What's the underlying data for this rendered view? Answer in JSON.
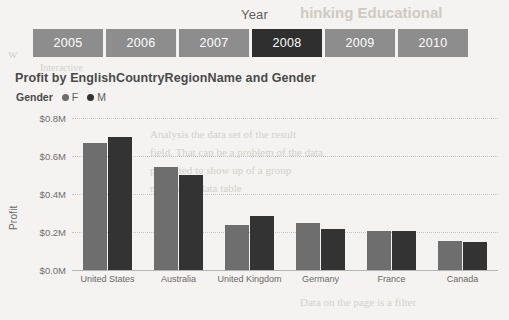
{
  "background_text": {
    "lines": [
      {
        "text": "hinking Educational",
        "x": 300,
        "y": 4,
        "size": 15,
        "head": true
      },
      {
        "text": "w",
        "x": 8,
        "y": 46,
        "size": 13,
        "head": false
      },
      {
        "text": "Interactive",
        "x": 40,
        "y": 62,
        "size": 10,
        "head": false
      },
      {
        "text": "Analysis the data set of the result",
        "x": 150,
        "y": 128,
        "size": 11,
        "head": false
      },
      {
        "text": "field. That can be a problem of the data",
        "x": 150,
        "y": 146,
        "size": 11,
        "head": false
      },
      {
        "text": "presented to show up of a group",
        "x": 150,
        "y": 164,
        "size": 11,
        "head": false
      },
      {
        "text": "may in the data table",
        "x": 150,
        "y": 182,
        "size": 11,
        "head": false
      },
      {
        "text": "Data on the page is a filter",
        "x": 300,
        "y": 296,
        "size": 11,
        "head": false
      }
    ]
  },
  "slicer": {
    "title": "Year",
    "name": "year-slicer",
    "items": [
      {
        "label": "2005",
        "selected": false
      },
      {
        "label": "2006",
        "selected": false
      },
      {
        "label": "2007",
        "selected": false
      },
      {
        "label": "2008",
        "selected": true
      },
      {
        "label": "2009",
        "selected": false
      },
      {
        "label": "2010",
        "selected": false
      }
    ],
    "colors": {
      "tile": "#8d8d8d",
      "tile_selected": "#2f2f2f",
      "text": "#ffffff"
    }
  },
  "chart_data": {
    "type": "bar",
    "title": "Profit by EnglishCountryRegionName and Gender",
    "xlabel": "",
    "ylabel": "Profit",
    "ylim": [
      0,
      0.8
    ],
    "ytick_labels": [
      "$0.8M",
      "$0.6M",
      "$0.4M",
      "$0.2M",
      "$0.0M"
    ],
    "ytick_values": [
      0.8,
      0.6,
      0.4,
      0.2,
      0.0
    ],
    "grid": true,
    "legend": {
      "title": "Gender",
      "position": "top-left",
      "entries": [
        {
          "name": "F",
          "color": "#6e6e6e"
        },
        {
          "name": "M",
          "color": "#333333"
        }
      ]
    },
    "categories": [
      "United States",
      "Australia",
      "United Kingdom",
      "Germany",
      "France",
      "Canada"
    ],
    "series": [
      {
        "name": "F",
        "color": "#6e6e6e",
        "values": [
          0.67,
          0.54,
          0.235,
          0.25,
          0.205,
          0.155
        ]
      },
      {
        "name": "M",
        "color": "#333333",
        "values": [
          0.7,
          0.5,
          0.285,
          0.215,
          0.205,
          0.145
        ]
      }
    ]
  }
}
